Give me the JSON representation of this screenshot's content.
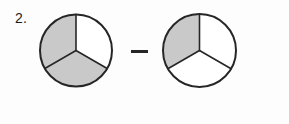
{
  "page": {
    "background_color": "#fdfdfd",
    "width": 289,
    "height": 124
  },
  "problem": {
    "number_label": "2.",
    "operator_label": "–",
    "operator_name": "minus-sign"
  },
  "style": {
    "shaded_fill": "#c9c9c9",
    "unshaded_fill": "#ffffff",
    "stroke_color": "#262626",
    "outline_width": 2,
    "divider_width": 1.6
  },
  "chart_data": {
    "type": "pie",
    "title": "",
    "xlabel": "",
    "ylabel": "",
    "legend": [],
    "figures": [
      {
        "name": "minuend-circle",
        "label": "first fraction circle",
        "center_x": 76,
        "center_y": 50.5,
        "radius": 36,
        "slices": 3,
        "slice_value": 120,
        "shaded_count": 2,
        "fraction": "2/3",
        "sectors": [
          {
            "name": "sector-top-right",
            "start_angle": 0,
            "end_angle": 120,
            "shaded": false
          },
          {
            "name": "sector-bottom",
            "start_angle": 120,
            "end_angle": 240,
            "shaded": true
          },
          {
            "name": "sector-top-left",
            "start_angle": 240,
            "end_angle": 360,
            "shaded": true
          }
        ]
      },
      {
        "name": "subtrahend-circle",
        "label": "second fraction circle",
        "center_x": 199.5,
        "center_y": 50.5,
        "radius": 36.5,
        "slices": 3,
        "slice_value": 120,
        "shaded_count": 1,
        "fraction": "1/3",
        "sectors": [
          {
            "name": "sector-top-right",
            "start_angle": 0,
            "end_angle": 120,
            "shaded": false
          },
          {
            "name": "sector-bottom",
            "start_angle": 120,
            "end_angle": 240,
            "shaded": false
          },
          {
            "name": "sector-top-left",
            "start_angle": 240,
            "end_angle": 360,
            "shaded": true
          }
        ]
      }
    ],
    "operator": {
      "name": "minus-sign",
      "symbol": "–",
      "x1": 131,
      "x2": 148,
      "y": 51.5
    }
  }
}
